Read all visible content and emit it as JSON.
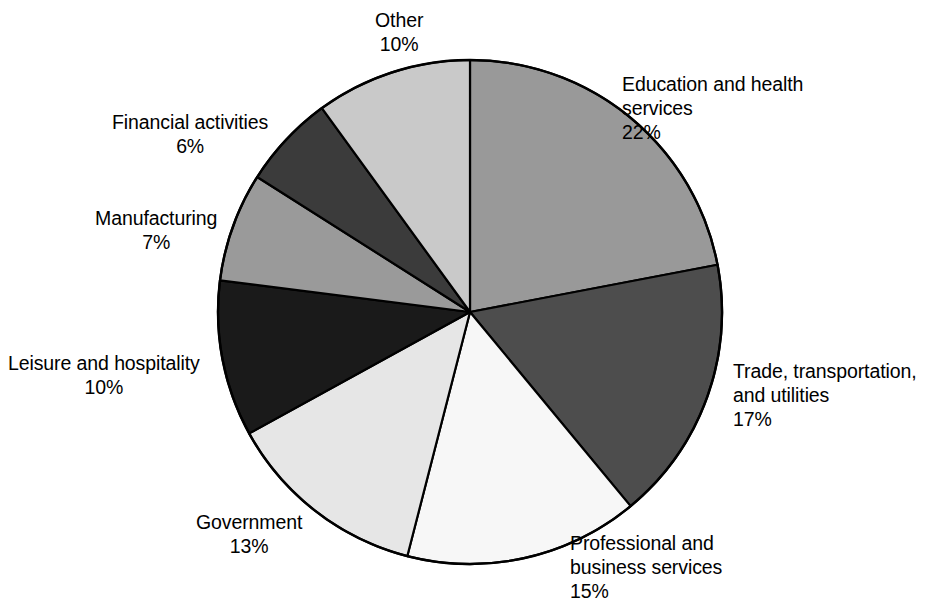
{
  "chart_data": {
    "type": "pie",
    "title": "",
    "subtitle": "",
    "xlabel": "",
    "ylabel": "",
    "legend_position": "none",
    "grid": false,
    "units": "percent",
    "start_angle_deg": 0,
    "direction": "clockwise",
    "total": 100,
    "categories": [
      "Education and health services",
      "Trade, transportation, and utilities",
      "Professional and business services",
      "Government",
      "Leisure and hospitality",
      "Manufacturing",
      "Financial activities",
      "Other"
    ],
    "values": [
      22,
      17,
      15,
      13,
      10,
      7,
      6,
      10
    ],
    "slices": [
      {
        "name": "Education and health services",
        "label_lines": "Education and health\nservices",
        "percent_text": "22%",
        "value": 22,
        "color": "#999999",
        "label_x": 622,
        "label_y": 72,
        "label_align": "left"
      },
      {
        "name": "Trade, transportation, and utilities",
        "label_lines": "Trade, transportation,\nand utilities",
        "percent_text": "17%",
        "value": 17,
        "color": "#4d4d4d",
        "label_x": 733,
        "label_y": 359,
        "label_align": "left"
      },
      {
        "name": "Professional and business services",
        "label_lines": "Professional and\nbusiness services",
        "percent_text": "15%",
        "value": 15,
        "color": "#f7f7f7",
        "label_x": 570,
        "label_y": 531,
        "label_align": "left"
      },
      {
        "name": "Government",
        "label_lines": "Government",
        "percent_text": "13%",
        "value": 13,
        "color": "#e6e6e6",
        "label_x": 196,
        "label_y": 510,
        "label_align": "center"
      },
      {
        "name": "Leisure and hospitality",
        "label_lines": "Leisure and hospitality",
        "percent_text": "10%",
        "value": 10,
        "color": "#1a1a1a",
        "label_x": 8,
        "label_y": 351,
        "label_align": "center"
      },
      {
        "name": "Manufacturing",
        "label_lines": "Manufacturing",
        "percent_text": "7%",
        "value": 7,
        "color": "#9a9a9a",
        "label_x": 95,
        "label_y": 206,
        "label_align": "center"
      },
      {
        "name": "Financial activities",
        "label_lines": "Financial activities",
        "percent_text": "6%",
        "value": 6,
        "color": "#3b3b3b",
        "label_x": 112,
        "label_y": 110,
        "label_align": "center"
      },
      {
        "name": "Other",
        "label_lines": "Other",
        "percent_text": "10%",
        "value": 10,
        "color": "#c9c9c9",
        "label_x": 375,
        "label_y": 8,
        "label_align": "center"
      }
    ],
    "geometry": {
      "center_x": 470,
      "center_y": 312,
      "radius": 252,
      "outline_color": "#000000",
      "background": "#ffffff"
    }
  }
}
